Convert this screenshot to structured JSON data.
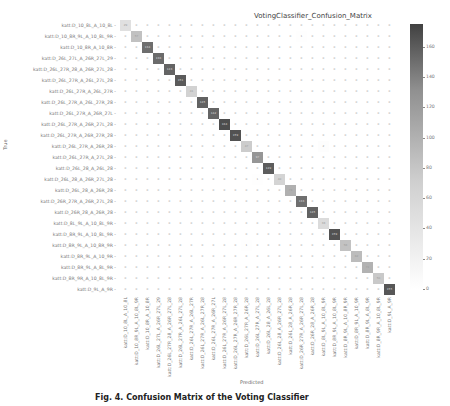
{
  "chart_data": {
    "type": "heatmap",
    "title": "VotingClassifier_Confusion_Matrix",
    "xlabel": "Predicted",
    "ylabel": "True",
    "labels": [
      "katt:D_10_8L_A_10_8L",
      "katt:D_10_8R_9L_A_10_8L_9R",
      "katt:D_10_8R_A_10_8R",
      "katt:D_26L_27L_A_26R_27L_29",
      "katt:D_26L_27R_28_A_26R_27L_28",
      "katt:D_26L_27R_A_26L_27L_28",
      "katt:D_26L_27R_A_26L_27R",
      "katt:D_26L_27R_A_26L_27R_28",
      "katt:D_26L_27R_A_26R_27L",
      "katt:D_26L_27R_A_26R_27L_28",
      "katt:D_26L_27R_A_26R_27R_28",
      "katt:D_26L_27R_A_26R_28",
      "katt:D_26L_27R_A_27L_28",
      "katt:D_26L_28_A_26L_28",
      "katt:D_26L_28_A_26R_27L_28",
      "katt:D_26L_28_A_26R_28",
      "katt:D_26R_27R_A_26R_27L_28",
      "katt:D_26R_28_A_26R_28",
      "katt:D_8L_9L_A_10_8L_9R",
      "katt:D_8R_9L_A_10_8L_9R",
      "katt:D_8R_9L_A_10_8R_9R",
      "katt:D_8R_9L_A_10_9R",
      "katt:D_8R_9L_A_8L_9R",
      "katt:D_8R_9R_A_10_8L_9R",
      "katt:D_9L_A_9R"
    ],
    "diagonal": [
      29,
      57,
      134,
      136,
      143,
      151,
      41,
      145,
      142,
      164,
      159,
      47,
      97,
      149,
      40,
      73,
      133,
      145,
      33,
      159,
      56,
      62,
      71,
      50,
      155
    ],
    "off_diagonal_nonzero": [
      {
        "row": 11,
        "col": 18,
        "value": 2
      },
      {
        "row": 14,
        "col": 12,
        "value": 1
      },
      {
        "row": 20,
        "col": 11,
        "value": 1
      },
      {
        "row": 1,
        "col": 16,
        "value": 1
      }
    ],
    "colorbar": {
      "ticks": [
        0,
        20,
        40,
        60,
        80,
        100,
        120,
        140,
        160
      ],
      "range": [
        0,
        175
      ],
      "colormap": "greys"
    },
    "grid": false,
    "legend": "colorbar-right"
  },
  "caption": "Fig. 4. Confusion Matrix of the Voting Classifier"
}
